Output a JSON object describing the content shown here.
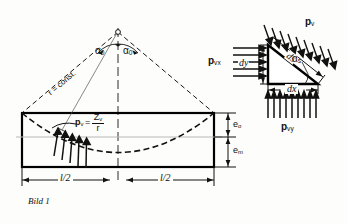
{
  "figure": {
    "caption": "Bild 1",
    "language": "de"
  },
  "left_diagram": {
    "name": "beam-with-tendon",
    "angle_left_label": "α",
    "angle_left_sub": "0",
    "angle_right_label": "α",
    "angle_right_sub": "0",
    "radius_label": "r = const.",
    "pressure_label_p": "p",
    "pressure_label_p_sub": "v",
    "pressure_equals": "=",
    "pressure_numerator": "Z",
    "pressure_numerator_sub": "v",
    "pressure_denominator": "r",
    "dim_left": "l/2",
    "dim_right": "l/2",
    "ecc_top_label": "e",
    "ecc_top_sub": "o",
    "ecc_bottom_label": "e",
    "ecc_bottom_sub": "m"
  },
  "right_diagram": {
    "name": "triangular-element",
    "pv_label": "p",
    "pv_sub": "v",
    "pvx_label": "p",
    "pvx_sub": "vx",
    "pvy_label": "p",
    "pvy_sub": "vy",
    "ds_label": "ds",
    "dx_label": "dx",
    "dy_label": "dy",
    "alpha_s_label": "α",
    "alpha_s_sub": "s"
  },
  "colors": {
    "ink": "#111111",
    "beam_outline": "#000000",
    "dashed": "#1a1a1a",
    "axis_gray": "#b9b9b9",
    "paper": "#fdfdfb"
  }
}
